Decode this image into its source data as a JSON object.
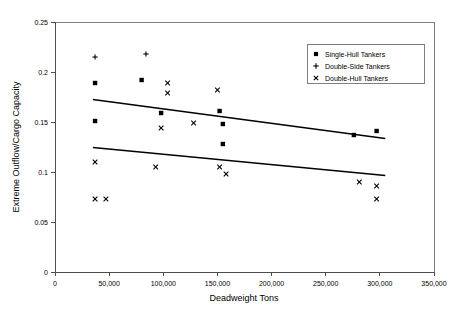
{
  "chart_data": {
    "type": "scatter",
    "title": "",
    "xlabel": "Deadweight Tons",
    "ylabel": "Extreme Outflow/Cargo Capacity",
    "xlim": [
      0,
      350000
    ],
    "ylim": [
      0,
      0.25
    ],
    "xticks": [
      0,
      50000,
      100000,
      150000,
      200000,
      250000,
      300000,
      350000
    ],
    "xtick_labels": [
      "0",
      "50,000",
      "100,000",
      "150,000",
      "200,000",
      "250,000",
      "300,000",
      "350,000"
    ],
    "yticks": [
      0,
      0.05,
      0.1,
      0.15,
      0.2,
      0.25
    ],
    "ytick_labels": [
      "0",
      "0.05",
      "0.1",
      "0.15",
      "0.2",
      "0.25"
    ],
    "grid": false,
    "legend_position": "top-right",
    "series": [
      {
        "name": "Single-Hull Tankers",
        "marker": "square",
        "color": "#000000",
        "points": [
          [
            37000,
            0.189
          ],
          [
            37000,
            0.151
          ],
          [
            80000,
            0.192
          ],
          [
            98000,
            0.159
          ],
          [
            152000,
            0.161
          ],
          [
            155000,
            0.148
          ],
          [
            155000,
            0.128
          ],
          [
            276000,
            0.137
          ],
          [
            297000,
            0.141
          ]
        ]
      },
      {
        "name": "Double-Side Tankers",
        "marker": "plus",
        "color": "#000000",
        "points": [
          [
            37000,
            0.215
          ],
          [
            84000,
            0.218
          ]
        ]
      },
      {
        "name": "Double-Hull Tankers",
        "marker": "cross",
        "color": "#000000",
        "points": [
          [
            37000,
            0.11
          ],
          [
            37000,
            0.073
          ],
          [
            47000,
            0.073
          ],
          [
            93000,
            0.105
          ],
          [
            98000,
            0.144
          ],
          [
            104000,
            0.189
          ],
          [
            104000,
            0.179
          ],
          [
            128000,
            0.149
          ],
          [
            150000,
            0.182
          ],
          [
            152000,
            0.105
          ],
          [
            158000,
            0.098
          ],
          [
            281000,
            0.09
          ],
          [
            297000,
            0.086
          ],
          [
            297000,
            0.073
          ]
        ]
      }
    ],
    "trendlines": [
      {
        "name": "upper-trendline",
        "for_series": "Single-Hull Tankers",
        "x_start": 35000,
        "y_start": 0.1725,
        "x_end": 305000,
        "y_end": 0.1335
      },
      {
        "name": "lower-trendline",
        "for_series": "Double-Hull Tankers",
        "x_start": 35000,
        "y_start": 0.1245,
        "x_end": 305000,
        "y_end": 0.0965
      }
    ]
  },
  "legend": {
    "items": [
      {
        "label": "Single-Hull Tankers",
        "marker": "square"
      },
      {
        "label": "Double-Side Tankers",
        "marker": "plus"
      },
      {
        "label": "Double-Hull Tankers",
        "marker": "cross"
      }
    ]
  }
}
